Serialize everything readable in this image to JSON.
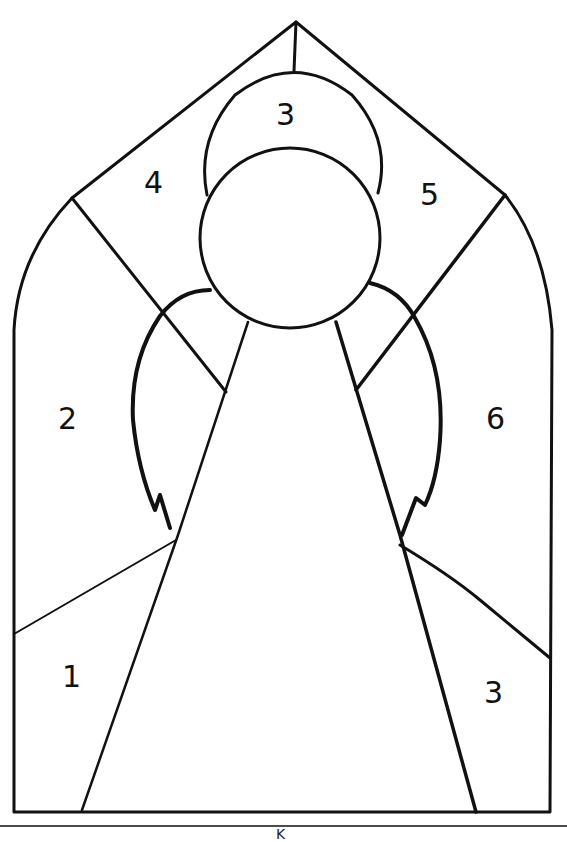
{
  "regions": [
    {
      "id": "halo",
      "number": "3"
    },
    {
      "id": "upper-left-panel",
      "number": "4"
    },
    {
      "id": "upper-right-panel",
      "number": "5"
    },
    {
      "id": "left-wing-panel",
      "number": "2"
    },
    {
      "id": "right-wing-panel",
      "number": "6"
    },
    {
      "id": "lower-left-panel",
      "number": "1"
    },
    {
      "id": "lower-right-panel",
      "number": "3"
    }
  ],
  "footer": {
    "text": "K"
  },
  "colors": {
    "line": "#111111",
    "background": "#ffffff"
  }
}
